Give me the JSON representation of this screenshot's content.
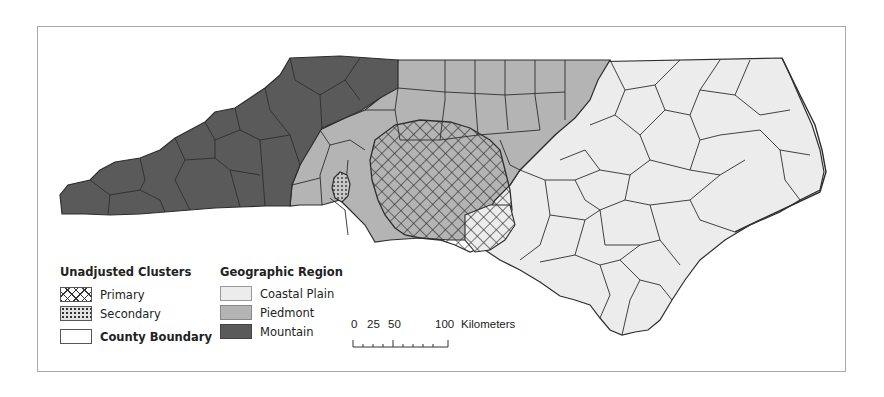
{
  "map": {
    "subject": "North Carolina counties",
    "colors": {
      "coastal_plain": "#ececec",
      "piedmont": "#b4b4b4",
      "mountain": "#5a5a5a",
      "county_boundary": "#2e2e2e",
      "frame": "#a8a8a8"
    }
  },
  "legend": {
    "clusters": {
      "title": "Unadjusted Clusters",
      "items": [
        {
          "label": "Primary",
          "symbol": "crosshatch"
        },
        {
          "label": "Secondary",
          "symbol": "dotted"
        },
        {
          "label": "County Boundary",
          "symbol": "outline"
        }
      ]
    },
    "regions": {
      "title": "Geographic Region",
      "items": [
        {
          "label": "Coastal Plain",
          "color": "#ececec"
        },
        {
          "label": "Piedmont",
          "color": "#b4b4b4"
        },
        {
          "label": "Mountain",
          "color": "#5a5a5a"
        }
      ]
    }
  },
  "scale_bar": {
    "ticks": [
      "0",
      "25",
      "50",
      "100"
    ],
    "unit": "Kilometers"
  }
}
